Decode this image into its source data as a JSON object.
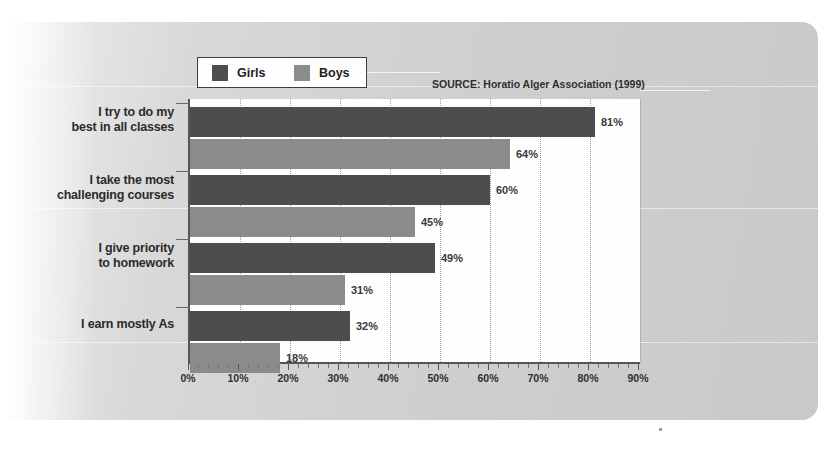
{
  "legend": {
    "items": [
      {
        "label": "Girls",
        "color": "#4d4d4d",
        "swatch": "girls-swatch"
      },
      {
        "label": "Boys",
        "color": "#8b8b8b",
        "swatch": "boys-swatch"
      }
    ]
  },
  "source_note": "SOURCE: Horatio Alger Association (1999)",
  "chart_data": {
    "type": "bar",
    "orientation": "horizontal",
    "title": "",
    "subtitle": "",
    "xlabel": "",
    "ylabel": "",
    "xlim": [
      0,
      90
    ],
    "grid": true,
    "legend_position": "top-left",
    "categories": [
      "I try to do my best in all classes",
      "I take the most challenging courses",
      "I give priority to homework",
      "I earn mostly As"
    ],
    "category_lines": [
      [
        "I try to do my",
        "best in all classes"
      ],
      [
        "I take the most",
        "challenging courses"
      ],
      [
        "I give priority",
        "to homework"
      ],
      [
        "I earn mostly As"
      ]
    ],
    "series": [
      {
        "name": "Girls",
        "color": "#4d4d4d",
        "values": [
          81,
          60,
          49,
          32
        ],
        "labels": [
          "81%",
          "64%",
          "49%",
          "32%"
        ]
      },
      {
        "name": "Boys",
        "color": "#8b8b8b",
        "values": [
          64,
          45,
          31,
          18
        ],
        "labels": [
          "64%",
          "45%",
          "31%",
          "18%"
        ]
      }
    ],
    "value_labels": {
      "girls": [
        "81%",
        "60%",
        "49%",
        "32%"
      ],
      "boys": [
        "64%",
        "45%",
        "31%",
        "18%"
      ]
    },
    "xticks": [
      0,
      10,
      20,
      30,
      40,
      50,
      60,
      70,
      80,
      90
    ],
    "xtick_labels": [
      "0%",
      "10%",
      "20%",
      "30%",
      "40%",
      "50%",
      "60%",
      "70%",
      "80%",
      "90%"
    ]
  }
}
